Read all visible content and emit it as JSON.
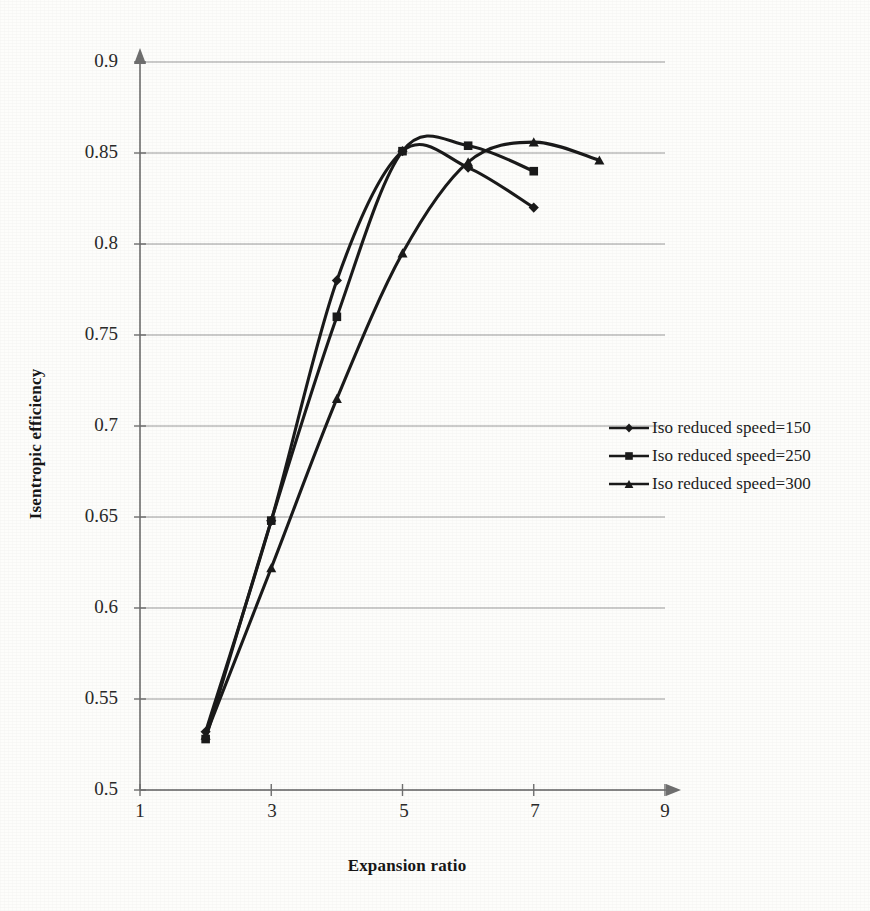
{
  "chart_data": {
    "type": "line",
    "title": "",
    "xlabel": "Expansion ratio",
    "ylabel": "Isentropic efficiency",
    "xlim": [
      1,
      9
    ],
    "ylim": [
      0.5,
      0.9
    ],
    "xticks": [
      1,
      3,
      5,
      7,
      9
    ],
    "yticks": [
      0.5,
      0.55,
      0.6,
      0.65,
      0.7,
      0.75,
      0.8,
      0.85,
      0.9
    ],
    "xtick_labels": [
      "1",
      "3",
      "5",
      "7",
      "9"
    ],
    "ytick_labels": [
      "0.5",
      "0.55",
      "0.6",
      "0.65",
      "0.7",
      "0.75",
      "0.8",
      "0.85",
      "0.9"
    ],
    "grid": "horizontal",
    "legend_position": "right",
    "series": [
      {
        "name": "Iso reduced speed=150",
        "marker": "diamond",
        "color": "#1a1a1a",
        "x": [
          2,
          3,
          4,
          5,
          6,
          7
        ],
        "y": [
          0.532,
          0.648,
          0.78,
          0.851,
          0.842,
          0.82
        ]
      },
      {
        "name": "Iso reduced speed=250",
        "marker": "square",
        "color": "#1a1a1a",
        "x": [
          2,
          3,
          4,
          5,
          6,
          7
        ],
        "y": [
          0.528,
          0.648,
          0.76,
          0.851,
          0.854,
          0.84
        ]
      },
      {
        "name": "Iso reduced speed=300",
        "marker": "triangle",
        "color": "#1a1a1a",
        "x": [
          2,
          3,
          4,
          5,
          6,
          7,
          8
        ],
        "y": [
          0.53,
          0.622,
          0.715,
          0.795,
          0.845,
          0.856,
          0.846
        ]
      }
    ]
  },
  "axes": {
    "y_title": "Isentropic efficiency",
    "x_title": "Expansion ratio"
  },
  "legend": {
    "entries": [
      {
        "label": "Iso reduced speed=150",
        "marker": "diamond-marker-icon"
      },
      {
        "label": "Iso reduced speed=250",
        "marker": "square-marker-icon"
      },
      {
        "label": "Iso reduced speed=300",
        "marker": "triangle-marker-icon"
      }
    ]
  },
  "yticks": {
    "t0": "0.9",
    "t1": "0.85",
    "t2": "0.8",
    "t3": "0.75",
    "t4": "0.7",
    "t5": "0.65",
    "t6": "0.6",
    "t7": "0.55",
    "t8": "0.5"
  },
  "xticks": {
    "t0": "1",
    "t1": "3",
    "t2": "5",
    "t3": "7",
    "t4": "9"
  },
  "colors": {
    "line": "#1a1a1a",
    "grid": "#8a8a8a",
    "axis": "#6f6f6f",
    "background": "#fdfdfb"
  }
}
